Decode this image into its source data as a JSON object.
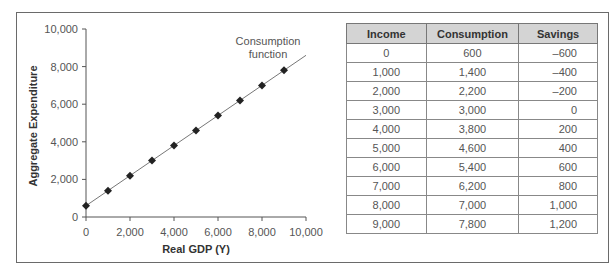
{
  "chart_data": {
    "type": "line",
    "title": "",
    "xlabel": "Real GDP (Y)",
    "ylabel": "Aggregate Expenditure",
    "xlim": [
      0,
      10000
    ],
    "ylim": [
      0,
      10000
    ],
    "grid": false,
    "x_ticks": [
      "0",
      "2,000",
      "4,000",
      "6,000",
      "8,000",
      "10,000"
    ],
    "y_ticks": [
      "0",
      "2,000",
      "4,000",
      "6,000",
      "8,000",
      "10,000"
    ],
    "annotation": [
      "Consumption",
      "function"
    ],
    "series": [
      {
        "name": "Consumption function",
        "marker": "diamond",
        "x": [
          0,
          1000,
          2000,
          3000,
          4000,
          5000,
          6000,
          7000,
          8000,
          9000
        ],
        "y": [
          600,
          1400,
          2200,
          3000,
          3800,
          4600,
          5400,
          6200,
          7000,
          7800
        ]
      }
    ],
    "line_extends_to": {
      "x": 10000,
      "y": 8600
    }
  },
  "table": {
    "headers": [
      "Income",
      "Consumption",
      "Savings"
    ],
    "rows": [
      [
        "0",
        "600",
        "–600"
      ],
      [
        "1,000",
        "1,400",
        "–400"
      ],
      [
        "2,000",
        "2,200",
        "–200"
      ],
      [
        "3,000",
        "3,000",
        "0"
      ],
      [
        "4,000",
        "3,800",
        "200"
      ],
      [
        "5,000",
        "4,600",
        "400"
      ],
      [
        "6,000",
        "5,400",
        "600"
      ],
      [
        "7,000",
        "6,200",
        "800"
      ],
      [
        "8,000",
        "7,000",
        "1,000"
      ],
      [
        "9,000",
        "7,800",
        "1,200"
      ]
    ]
  },
  "colors": {
    "line": "#777777",
    "marker": "#222222",
    "header_bg": "#d4d4d4",
    "border": "#6a6a6a"
  }
}
